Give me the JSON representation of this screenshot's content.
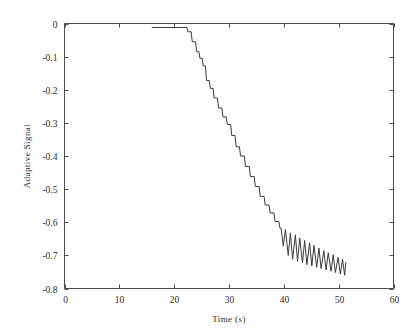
{
  "figure": {
    "background_color": "#ffffff",
    "axes_color": "#4d4d4d",
    "line_color": "#3a3a3a"
  },
  "axis": {
    "xlabel_text": "Time (",
    "xlabel_unit": "s",
    "xlabel_close": ")",
    "xlabel_full": "Time (s)",
    "ylabel": "Adaptive Signal",
    "xticks": [
      "0",
      "10",
      "20",
      "30",
      "40",
      "50",
      "60"
    ],
    "yticks": [
      "0",
      "-0.1",
      "-0.2",
      "-0.3",
      "-0.4",
      "-0.5",
      "-0.6",
      "-0.7",
      "-0.8"
    ]
  },
  "chart_data": {
    "type": "line",
    "title": "",
    "xlabel": "Time (s)",
    "ylabel": "Adaptive Signal",
    "xlim": [
      0,
      60
    ],
    "ylim": [
      -0.8,
      0
    ],
    "xticks": [
      0,
      10,
      20,
      30,
      40,
      50,
      60
    ],
    "yticks": [
      0,
      -0.1,
      -0.2,
      -0.3,
      -0.4,
      -0.5,
      -0.6,
      -0.7,
      -0.8
    ],
    "grid": false,
    "legend": null,
    "series": [
      {
        "name": "Adaptive Signal",
        "color": "#3a3a3a",
        "description": "Signal stays near zero until t=22 s, then descends as a staircase of discrete steps to about -0.62 by t=39 s, after which it oscillates with roughly 0.85 s period and decaying amplitude about a mean drifting to -0.75, ending at t=51.3 s.",
        "x": [
          16.0,
          22.3,
          22.5,
          23.1,
          23.3,
          23.9,
          24.1,
          24.5,
          24.7,
          25.1,
          25.3,
          25.7,
          25.9,
          26.4,
          26.6,
          27.1,
          27.3,
          27.9,
          28.1,
          28.7,
          28.9,
          29.5,
          29.7,
          30.3,
          30.5,
          31.1,
          31.3,
          31.9,
          32.1,
          32.8,
          33.0,
          33.7,
          33.9,
          34.6,
          34.8,
          35.5,
          35.7,
          36.4,
          36.6,
          37.3,
          37.5,
          38.2,
          38.4,
          39.1,
          39.3,
          39.5,
          39.9,
          40.3,
          40.8,
          41.2,
          41.6,
          42.1,
          42.5,
          42.9,
          43.4,
          43.8,
          44.2,
          44.7,
          45.1,
          45.5,
          46.0,
          46.4,
          46.8,
          47.3,
          47.7,
          48.1,
          48.6,
          49.0,
          49.4,
          49.9,
          50.3,
          50.7,
          51.1,
          51.3
        ],
        "y": [
          -0.012,
          -0.012,
          -0.025,
          -0.025,
          -0.055,
          -0.055,
          -0.085,
          -0.085,
          -0.105,
          -0.105,
          -0.128,
          -0.128,
          -0.172,
          -0.172,
          -0.196,
          -0.196,
          -0.225,
          -0.225,
          -0.255,
          -0.255,
          -0.282,
          -0.282,
          -0.305,
          -0.305,
          -0.338,
          -0.338,
          -0.372,
          -0.372,
          -0.4,
          -0.4,
          -0.432,
          -0.432,
          -0.462,
          -0.462,
          -0.492,
          -0.492,
          -0.522,
          -0.522,
          -0.548,
          -0.548,
          -0.572,
          -0.572,
          -0.598,
          -0.598,
          -0.618,
          -0.618,
          -0.672,
          -0.622,
          -0.7,
          -0.632,
          -0.712,
          -0.638,
          -0.718,
          -0.648,
          -0.722,
          -0.655,
          -0.728,
          -0.662,
          -0.732,
          -0.67,
          -0.736,
          -0.678,
          -0.74,
          -0.686,
          -0.744,
          -0.692,
          -0.748,
          -0.698,
          -0.752,
          -0.706,
          -0.756,
          -0.712,
          -0.76,
          -0.722
        ]
      }
    ]
  }
}
